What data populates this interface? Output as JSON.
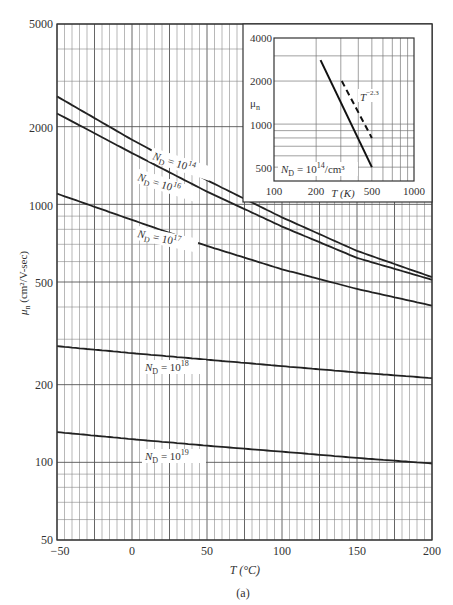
{
  "chart_data": [
    {
      "type": "line",
      "title": "",
      "xlabel": "T (°C)",
      "ylabel": "μn (cm²/V-sec)",
      "xscale": "linear",
      "yscale": "log",
      "xlim": [
        -50,
        200
      ],
      "ylim": [
        50,
        5000
      ],
      "xticks": [
        -50,
        0,
        50,
        100,
        150,
        200
      ],
      "yticks": [
        50,
        100,
        200,
        500,
        1000,
        2000,
        5000
      ],
      "grid": true,
      "caption": "(a)",
      "x": [
        -50,
        0,
        50,
        100,
        150,
        200
      ],
      "series": [
        {
          "name": "ND = 10^14",
          "values": [
            2620,
            1780,
            1240,
            890,
            660,
            522
          ]
        },
        {
          "name": "ND = 10^16",
          "values": [
            2250,
            1580,
            1120,
            820,
            620,
            510
          ]
        },
        {
          "name": "ND = 10^17",
          "values": [
            1100,
            870,
            690,
            560,
            470,
            405
          ]
        },
        {
          "name": "ND = 10^18",
          "values": [
            282,
            265,
            250,
            236,
            223,
            212
          ]
        },
        {
          "name": "ND = 10^19",
          "values": [
            131,
            123,
            116,
            110,
            104,
            99
          ]
        }
      ]
    },
    {
      "type": "line",
      "title": "inset",
      "xlabel": "T (K)",
      "ylabel": "μn",
      "xscale": "log",
      "yscale": "log",
      "xlim": [
        100,
        1000
      ],
      "ylim": [
        400,
        4000
      ],
      "xticks": [
        100,
        200,
        500,
        1000
      ],
      "yticks": [
        500,
        1000,
        2000,
        4000
      ],
      "grid": true,
      "annotation": "ND = 10^14/cm^3",
      "series": [
        {
          "name": "ND = 10^14/cm^3 (measured)",
          "style": "solid",
          "x": [
            215,
            500
          ],
          "values": [
            2800,
            500
          ]
        },
        {
          "name": "T^-2.3",
          "style": "dashed",
          "x": [
            305,
            500
          ],
          "values": [
            2000,
            800
          ]
        }
      ]
    }
  ],
  "labels": {
    "y_ticks": [
      "5000",
      "2000",
      "1000",
      "500",
      "200",
      "100",
      "50"
    ],
    "x_ticks": [
      "−50",
      "0",
      "50",
      "100",
      "150",
      "200"
    ],
    "x_axis": "T (°C)",
    "y_axis_mu": "μ",
    "y_axis_sub": "n",
    "y_axis_units": " (cm²/V-sec)",
    "caption": "(a)",
    "curves": [
      {
        "prefix": "N",
        "sub": "D",
        "eq": " = 10",
        "exp": "14"
      },
      {
        "prefix": "N",
        "sub": "D",
        "eq": " = 10",
        "exp": "16"
      },
      {
        "prefix": "N",
        "sub": "D",
        "eq": " = 10",
        "exp": "17"
      },
      {
        "prefix": "N",
        "sub": "D",
        "eq": " = 10",
        "exp": "18"
      },
      {
        "prefix": "N",
        "sub": "D",
        "eq": " = 10",
        "exp": "19"
      }
    ],
    "inset": {
      "y_ticks": [
        "4000",
        "2000",
        "1000",
        "500"
      ],
      "x_ticks": [
        "100",
        "200",
        "500",
        "1000"
      ],
      "y_axis_mu": "μ",
      "y_axis_sub": "n",
      "x_axis": "T (K)",
      "power_base": "T",
      "power_exp": "−2.3",
      "nd_prefix": "N",
      "nd_sub": "D",
      "nd_eq": " = 10",
      "nd_exp": "14",
      "nd_units": "/cm³"
    }
  }
}
